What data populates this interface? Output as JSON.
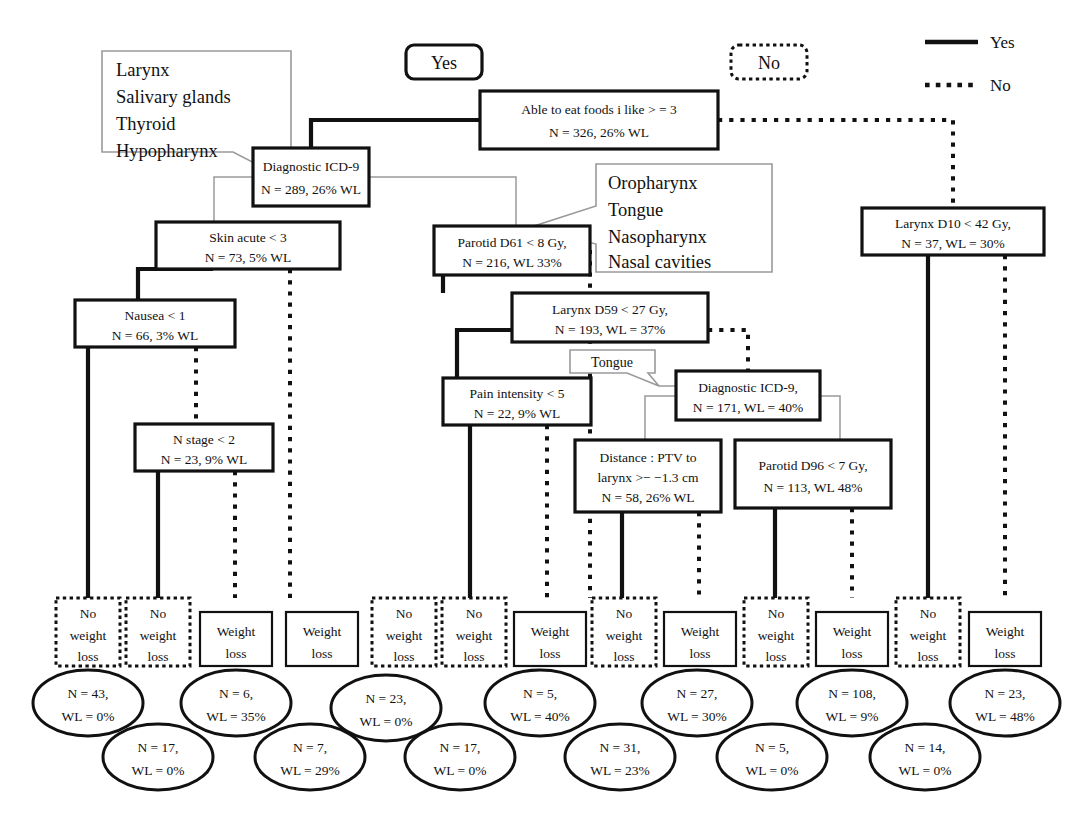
{
  "figure": {
    "type": "decision-tree",
    "title_visible": false
  },
  "legend": {
    "items": [
      {
        "label": "Yes",
        "style": "solid",
        "icon": "solid-line-icon"
      },
      {
        "label": "No",
        "style": "dotted",
        "icon": "dotted-line-icon"
      }
    ]
  },
  "branch_labels": {
    "yes": "Yes",
    "no": "No"
  },
  "callouts": [
    {
      "id": "callout-left",
      "lines": [
        "Larynx",
        "Salivary glands",
        "Thyroid",
        "Hypopharynx"
      ],
      "points_to": "Diagnostic ICD-9 N = 289, 26% WL"
    },
    {
      "id": "callout-right",
      "lines": [
        "Oropharynx",
        "Tongue",
        "Nasopharynx",
        "Nasal cavities"
      ],
      "points_to": "Parotid D61 < 8 Gy, N = 216, WL 33%"
    },
    {
      "id": "callout-tongue",
      "lines": [
        "Tongue"
      ],
      "points_to": "Diagnostic ICD-9, N = 171, WL = 40%"
    }
  ],
  "nodes": [
    {
      "id": "n1",
      "line1": "Able to eat foods i like > = 3",
      "line2": "N = 326, 26% WL"
    },
    {
      "id": "n2",
      "line1": "Diagnostic ICD-9",
      "line2": "N = 289, 26% WL"
    },
    {
      "id": "n3",
      "line1": "Larynx D10 < 42 Gy,",
      "line2": "N = 37, WL = 30%"
    },
    {
      "id": "n4",
      "line1": "Skin acute < 3",
      "line2": "N = 73, 5% WL"
    },
    {
      "id": "n5",
      "line1": "Parotid D61 < 8 Gy,",
      "line2": "N = 216, WL 33%"
    },
    {
      "id": "n6",
      "line1": "Nausea < 1",
      "line2": "N = 66, 3% WL"
    },
    {
      "id": "n7",
      "line1": "Larynx D59 < 27 Gy,",
      "line2": "N = 193, WL = 37%"
    },
    {
      "id": "n8",
      "line1": "N stage < 2",
      "line2": "N = 23, 9% WL"
    },
    {
      "id": "n9",
      "line1": "Pain intensity < 5",
      "line2": "N = 22, 9% WL"
    },
    {
      "id": "n10",
      "line1": "Diagnostic ICD-9,",
      "line2": "N = 171, WL = 40%"
    },
    {
      "id": "n11",
      "line1": "Distance : PTV to",
      "line2": "larynx >− −1.3 cm",
      "line3": "N = 58, 26% WL"
    },
    {
      "id": "n12",
      "line1": "Parotid D96 < 7 Gy,",
      "line2": "N = 113, WL 48%"
    }
  ],
  "leaves": [
    {
      "id": "l1",
      "kind": "no-weight-loss",
      "lines": [
        "No",
        "weight",
        "loss"
      ]
    },
    {
      "id": "l2",
      "kind": "no-weight-loss",
      "lines": [
        "No",
        "weight",
        "loss"
      ]
    },
    {
      "id": "l3",
      "kind": "weight-loss",
      "lines": [
        "Weight",
        "loss"
      ]
    },
    {
      "id": "l4",
      "kind": "weight-loss",
      "lines": [
        "Weight",
        "loss"
      ]
    },
    {
      "id": "l5",
      "kind": "no-weight-loss",
      "lines": [
        "No",
        "weight",
        "loss"
      ]
    },
    {
      "id": "l6",
      "kind": "no-weight-loss",
      "lines": [
        "No",
        "weight",
        "loss"
      ]
    },
    {
      "id": "l7",
      "kind": "weight-loss",
      "lines": [
        "Weight",
        "loss"
      ]
    },
    {
      "id": "l8",
      "kind": "no-weight-loss",
      "lines": [
        "No",
        "weight",
        "loss"
      ]
    },
    {
      "id": "l9",
      "kind": "weight-loss",
      "lines": [
        "Weight",
        "loss"
      ]
    },
    {
      "id": "l10",
      "kind": "no-weight-loss",
      "lines": [
        "No",
        "weight",
        "loss"
      ]
    },
    {
      "id": "l11",
      "kind": "weight-loss",
      "lines": [
        "Weight",
        "loss"
      ]
    },
    {
      "id": "l12",
      "kind": "no-weight-loss",
      "lines": [
        "No",
        "weight",
        "loss"
      ]
    },
    {
      "id": "l13",
      "kind": "weight-loss",
      "lines": [
        "Weight",
        "loss"
      ]
    }
  ],
  "terminals": [
    {
      "id": "t1",
      "n": "N = 43,",
      "wl": "WL = 0%",
      "row": "upper"
    },
    {
      "id": "t2",
      "n": "N = 17,",
      "wl": "WL = 0%",
      "row": "lower"
    },
    {
      "id": "t3",
      "n": "N = 6,",
      "wl": "WL = 35%",
      "row": "upper"
    },
    {
      "id": "t4",
      "n": "N = 7,",
      "wl": "WL = 29%",
      "row": "lower"
    },
    {
      "id": "t5",
      "n": "N = 23,",
      "wl": "WL = 0%",
      "row": "upper"
    },
    {
      "id": "t6",
      "n": "N = 17,",
      "wl": "WL = 0%",
      "row": "lower"
    },
    {
      "id": "t7",
      "n": "N = 5,",
      "wl": "WL = 40%",
      "row": "upper"
    },
    {
      "id": "t8",
      "n": "N = 31,",
      "wl": "WL = 23%",
      "row": "lower"
    },
    {
      "id": "t9",
      "n": "N = 27,",
      "wl": "WL = 30%",
      "row": "upper"
    },
    {
      "id": "t10",
      "n": "N = 5,",
      "wl": "WL = 0%",
      "row": "lower"
    },
    {
      "id": "t11",
      "n": "N = 108,",
      "wl": "WL = 9%",
      "row": "upper"
    },
    {
      "id": "t12",
      "n": "N = 14,",
      "wl": "WL = 0%",
      "row": "lower"
    },
    {
      "id": "t13",
      "n": "N = 23,",
      "wl": "WL = 48%",
      "row": "upper"
    }
  ],
  "colors": {
    "stroke": "#111111",
    "callout_stroke": "#9a9a9a",
    "background": "#ffffff"
  }
}
